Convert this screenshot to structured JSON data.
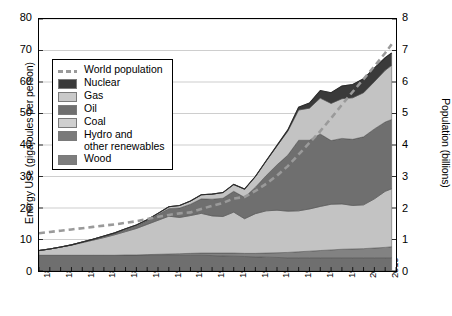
{
  "chart_data": {
    "type": "area",
    "title": "",
    "subtitle": "",
    "xlabel": "",
    "ylabel": "Energy Use (gigajoules per person)",
    "ylabel_right": "Population (billions)",
    "xlim": [
      1850,
      2015
    ],
    "ylim": [
      0,
      80
    ],
    "ylim_right": [
      0,
      8
    ],
    "grid": true,
    "stacked": true,
    "legend_position": "upper-left-inside",
    "x_tick_labels": [
      "1850",
      "1860",
      "1870",
      "1880",
      "1890",
      "1900",
      "1910",
      "1920",
      "1930",
      "1940",
      "1950",
      "1960",
      "1970",
      "1980",
      "1990",
      "2000",
      "2010"
    ],
    "y_tick_labels_left": [
      "0",
      "10",
      "20",
      "30",
      "40",
      "50",
      "60",
      "70",
      "80"
    ],
    "y_tick_labels_right": [
      "0",
      "1",
      "2",
      "3",
      "4",
      "5",
      "6",
      "7",
      "8"
    ],
    "x_minor_tick_step": 5,
    "x": [
      1850,
      1855,
      1860,
      1865,
      1870,
      1875,
      1880,
      1885,
      1890,
      1895,
      1900,
      1905,
      1910,
      1915,
      1920,
      1925,
      1930,
      1935,
      1940,
      1945,
      1950,
      1955,
      1960,
      1965,
      1970,
      1975,
      1980,
      1985,
      1990,
      1995,
      2000,
      2005,
      2010,
      2013
    ],
    "series": [
      {
        "name": "Wood",
        "color": "#6f6f6f",
        "values": [
          5.0,
          5.0,
          5.0,
          5.0,
          5.0,
          5.0,
          5.0,
          5.0,
          5.0,
          5.0,
          5.0,
          5.0,
          5.0,
          5.0,
          5.0,
          5.0,
          4.9,
          4.8,
          4.7,
          4.6,
          4.5,
          4.4,
          4.3,
          4.2,
          4.2,
          4.2,
          4.2,
          4.2,
          4.2,
          4.2,
          4.2,
          4.2,
          4.2,
          4.2
        ]
      },
      {
        "name": "Hydro and other renewables",
        "color": "#828282",
        "values": [
          0.0,
          0.0,
          0.0,
          0.0,
          0.0,
          0.0,
          0.0,
          0.0,
          0.1,
          0.1,
          0.2,
          0.3,
          0.4,
          0.5,
          0.6,
          0.7,
          0.8,
          0.9,
          1.0,
          1.0,
          1.1,
          1.3,
          1.5,
          1.7,
          1.9,
          2.1,
          2.3,
          2.5,
          2.7,
          2.8,
          2.9,
          3.1,
          3.3,
          3.5
        ]
      },
      {
        "name": "Coal",
        "color": "#c3c3c3",
        "values": [
          1.5,
          2.0,
          2.6,
          3.2,
          4.0,
          4.8,
          5.6,
          6.5,
          7.4,
          8.4,
          9.6,
          10.8,
          12.0,
          11.5,
          12.0,
          12.6,
          11.8,
          11.6,
          13.0,
          11.0,
          12.6,
          13.4,
          13.5,
          13.1,
          13.0,
          13.4,
          14.0,
          14.5,
          14.4,
          13.8,
          13.9,
          15.6,
          17.8,
          18.4
        ]
      },
      {
        "name": "Oil",
        "color": "#6f6f6f",
        "values": [
          0.0,
          0.0,
          0.0,
          0.1,
          0.2,
          0.3,
          0.4,
          0.5,
          0.7,
          0.9,
          1.2,
          1.8,
          2.4,
          3.0,
          3.6,
          4.6,
          5.3,
          5.8,
          6.6,
          6.8,
          8.4,
          11.2,
          14.4,
          17.8,
          22.4,
          21.8,
          23.0,
          20.2,
          20.8,
          21.0,
          21.6,
          22.2,
          22.0,
          22.0
        ]
      },
      {
        "name": "Gas",
        "color": "#c3c3c3",
        "values": [
          0.0,
          0.0,
          0.0,
          0.0,
          0.0,
          0.0,
          0.1,
          0.1,
          0.2,
          0.2,
          0.3,
          0.4,
          0.6,
          0.8,
          1.0,
          1.3,
          1.6,
          1.8,
          2.2,
          2.6,
          3.4,
          4.6,
          6.0,
          7.6,
          9.6,
          10.2,
          11.4,
          11.8,
          12.6,
          13.2,
          14.0,
          15.0,
          16.4,
          17.2
        ]
      },
      {
        "name": "Nuclear",
        "color": "#3a3a3a",
        "values": [
          0.0,
          0.0,
          0.0,
          0.0,
          0.0,
          0.0,
          0.0,
          0.0,
          0.0,
          0.0,
          0.0,
          0.0,
          0.0,
          0.0,
          0.0,
          0.0,
          0.0,
          0.0,
          0.0,
          0.0,
          0.0,
          0.1,
          0.2,
          0.4,
          0.9,
          1.6,
          2.4,
          3.4,
          4.0,
          4.2,
          4.4,
          4.3,
          4.0,
          3.9
        ]
      }
    ],
    "population_line": {
      "name": "World population",
      "color": "#9a9a9a",
      "style": "dashed",
      "axis": "right",
      "units": "billions",
      "values": [
        1.2,
        1.24,
        1.28,
        1.32,
        1.36,
        1.4,
        1.44,
        1.48,
        1.53,
        1.58,
        1.65,
        1.72,
        1.78,
        1.83,
        1.86,
        1.97,
        2.07,
        2.16,
        2.3,
        2.35,
        2.54,
        2.77,
        3.03,
        3.33,
        3.7,
        4.07,
        4.44,
        4.85,
        5.28,
        5.69,
        6.09,
        6.5,
        6.92,
        7.2
      ]
    },
    "annotations": []
  },
  "legend": {
    "entries": [
      {
        "label": "World population",
        "swatch": "dashed-line",
        "color": "#9a9a9a"
      },
      {
        "label": "Nuclear",
        "swatch": "filled",
        "color": "#3a3a3a"
      },
      {
        "label": "Gas",
        "swatch": "filled",
        "color": "#c9c9c9"
      },
      {
        "label": "Oil",
        "swatch": "filled",
        "color": "#6f6f6f"
      },
      {
        "label": "Coal",
        "swatch": "filled",
        "color": "#cfcfcf"
      },
      {
        "label": "Hydro and\nother renewables",
        "swatch": "filled",
        "color": "#7a7a7a"
      },
      {
        "label": "Wood",
        "swatch": "filled",
        "color": "#7d7d7d"
      }
    ]
  }
}
